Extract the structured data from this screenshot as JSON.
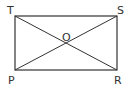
{
  "diagram": {
    "type": "geometry",
    "shape": "rectangle",
    "stroke_color": "#333333",
    "background": "#ffffff",
    "vertices": {
      "T": {
        "label": "T",
        "x": 15,
        "y": 16
      },
      "S": {
        "label": "S",
        "x": 117,
        "y": 16
      },
      "R": {
        "label": "R",
        "x": 117,
        "y": 70
      },
      "P": {
        "label": "P",
        "x": 15,
        "y": 70
      }
    },
    "center": {
      "label": "O",
      "x": 66,
      "y": 43
    },
    "edges": [
      {
        "from": "T",
        "to": "S"
      },
      {
        "from": "S",
        "to": "R"
      },
      {
        "from": "R",
        "to": "P"
      },
      {
        "from": "P",
        "to": "T"
      }
    ],
    "diagonals": [
      {
        "from": "T",
        "to": "R"
      },
      {
        "from": "P",
        "to": "S"
      }
    ]
  }
}
